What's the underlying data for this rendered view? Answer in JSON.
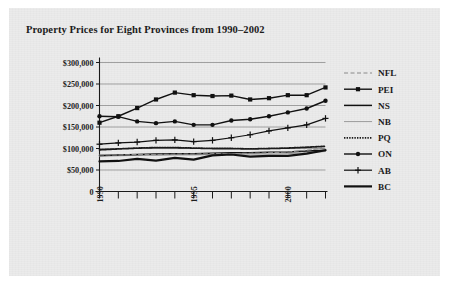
{
  "page": {
    "background_color": "#ffffff",
    "scan_color": "#ebebeb"
  },
  "chart_title": "Property Prices for Eight Provinces from 1990–2002",
  "axis": {
    "y_tick_labels": [
      "0",
      "$50,000",
      "$100,000",
      "$150,000",
      "$200,000",
      "$250,000",
      "$300,000"
    ],
    "x_tick_labels_visible": [
      "1990",
      "1995",
      "2000"
    ]
  },
  "legend": {
    "items": [
      {
        "label": "NFL",
        "style": "dashed",
        "marker": "none",
        "color": "#8a8a8a",
        "width": 1.1
      },
      {
        "label": "PEI",
        "style": "solid",
        "marker": "square",
        "color": "#111111",
        "width": 1.4
      },
      {
        "label": "NS",
        "style": "solid",
        "marker": "none",
        "color": "#111111",
        "width": 1.5
      },
      {
        "label": "NB",
        "style": "solid",
        "marker": "none",
        "color": "#9a9a9a",
        "width": 1.0
      },
      {
        "label": "PQ",
        "style": "dotted",
        "marker": "none",
        "color": "#1a1a1a",
        "width": 1.8
      },
      {
        "label": "ON",
        "style": "solid",
        "marker": "circle",
        "color": "#111111",
        "width": 1.4
      },
      {
        "label": "AB",
        "style": "solid",
        "marker": "plus",
        "color": "#111111",
        "width": 1.2
      },
      {
        "label": "BC",
        "style": "solid",
        "marker": "none",
        "color": "#111111",
        "width": 2.2
      }
    ]
  },
  "chart_data": {
    "type": "line",
    "title": "Property Prices for Eight Provinces from 1990–2002",
    "xlabel": "",
    "ylabel": "",
    "x": [
      1990,
      1991,
      1992,
      1993,
      1994,
      1995,
      1996,
      1997,
      1998,
      1999,
      2000,
      2001,
      2002
    ],
    "xlim": [
      1990,
      2002
    ],
    "ylim": [
      0,
      300000
    ],
    "ytick_step": 50000,
    "grid": true,
    "legend_position": "right",
    "series": [
      {
        "name": "NFL",
        "values": [
          85000,
          85000,
          86000,
          86000,
          87000,
          87000,
          88000,
          88000,
          89000,
          90000,
          92000,
          96000,
          101000
        ]
      },
      {
        "name": "PEI",
        "values": [
          160000,
          175000,
          194000,
          214000,
          230000,
          224000,
          222000,
          223000,
          214000,
          217000,
          224000,
          224000,
          242000
        ]
      },
      {
        "name": "NS",
        "values": [
          84000,
          85000,
          86000,
          87000,
          88000,
          88000,
          89000,
          90000,
          90000,
          91000,
          92000,
          94000,
          96000
        ]
      },
      {
        "name": "NB",
        "values": [
          82000,
          83000,
          84000,
          84000,
          85000,
          85000,
          86000,
          86000,
          87000,
          87000,
          88000,
          90000,
          93000
        ]
      },
      {
        "name": "PQ",
        "values": [
          97000,
          99000,
          101000,
          102000,
          102000,
          101000,
          100000,
          100000,
          99000,
          100000,
          101000,
          103000,
          105000
        ]
      },
      {
        "name": "ON",
        "values": [
          175000,
          174000,
          163000,
          159000,
          163000,
          155000,
          155000,
          165000,
          168000,
          175000,
          184000,
          193000,
          211000
        ]
      },
      {
        "name": "AB",
        "values": [
          110000,
          113000,
          115000,
          119000,
          120000,
          116000,
          119000,
          125000,
          132000,
          141000,
          148000,
          155000,
          170000
        ]
      },
      {
        "name": "BC",
        "values": [
          70000,
          71000,
          76000,
          72000,
          78000,
          74000,
          84000,
          86000,
          81000,
          83000,
          83000,
          88000,
          96000
        ]
      }
    ]
  }
}
